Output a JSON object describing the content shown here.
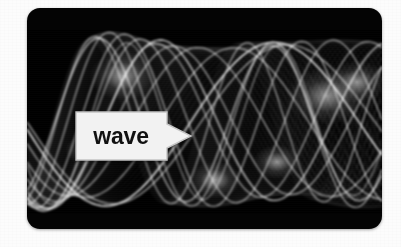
{
  "page": {
    "background_color": "#fcfcfc",
    "width": 401,
    "height": 247
  },
  "card": {
    "name": "wave-visualization-card",
    "background_color": "#040404",
    "corner_radius_px": 13,
    "left": 27,
    "top": 8,
    "width": 355,
    "height": 221
  },
  "figure": {
    "name": "wave-interference-figure",
    "description_alt": "Dense bundle of white sine waves on black",
    "stroke_color": "#ffffff",
    "background_color": "#000000",
    "band_top": 22,
    "band_height": 184
  },
  "callout": {
    "name": "wave-callout-tag",
    "label": "wave",
    "fill_color": "#f2f2f2",
    "text_color": "#111111",
    "border_color": "#c8c8c8",
    "pointer_direction": "right",
    "left": 48,
    "top": 103,
    "width": 118,
    "height": 50
  },
  "chart_data": {
    "type": "line",
    "title": "wave",
    "xlabel": "",
    "ylabel": "",
    "grid": false,
    "legend": "none",
    "xlim": [
      0,
      1
    ],
    "ylim": [
      -1,
      1
    ],
    "series_count": 60,
    "series": [
      {
        "name": "sine-bundle-low",
        "amplitude": 0.92,
        "frequency": 1.0,
        "phase": 0.0
      },
      {
        "name": "sine-bundle-mid",
        "amplitude": 0.92,
        "frequency": 1.6,
        "phase": 0.35
      },
      {
        "name": "sine-bundle-high",
        "amplitude": 0.92,
        "frequency": 2.3,
        "phase": 0.7
      }
    ]
  }
}
